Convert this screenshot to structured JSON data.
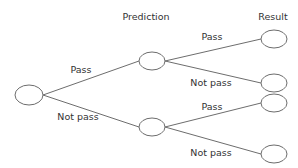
{
  "diagram": {
    "type": "decision-tree",
    "headers": {
      "prediction": "Prediction",
      "result": "Result"
    },
    "colors": {
      "line": "#6d6d6d",
      "text": "#333333",
      "node_fill": "#ffffff"
    },
    "nodes": [
      {
        "id": "root",
        "level": 0,
        "cx": 29,
        "cy": 95,
        "rx": 14,
        "ry": 10
      },
      {
        "id": "pred-pass",
        "level": 1,
        "cx": 152,
        "cy": 61,
        "rx": 13,
        "ry": 9
      },
      {
        "id": "pred-notpass",
        "level": 1,
        "cx": 152,
        "cy": 127,
        "rx": 13,
        "ry": 9
      },
      {
        "id": "res-1",
        "level": 2,
        "cx": 274,
        "cy": 39,
        "rx": 13,
        "ry": 9
      },
      {
        "id": "res-2",
        "level": 2,
        "cx": 274,
        "cy": 83,
        "rx": 13,
        "ry": 9
      },
      {
        "id": "res-3",
        "level": 2,
        "cx": 274,
        "cy": 103,
        "rx": 13,
        "ry": 9
      },
      {
        "id": "res-4",
        "level": 2,
        "cx": 274,
        "cy": 154,
        "rx": 13,
        "ry": 9
      }
    ],
    "edges": [
      {
        "from": "root",
        "to": "pred-pass",
        "label": "Pass"
      },
      {
        "from": "root",
        "to": "pred-notpass",
        "label": "Not pass"
      },
      {
        "from": "pred-pass",
        "to": "res-1",
        "label": "Pass"
      },
      {
        "from": "pred-pass",
        "to": "res-2",
        "label": "Not pass"
      },
      {
        "from": "pred-notpass",
        "to": "res-3",
        "label": "Pass"
      },
      {
        "from": "pred-notpass",
        "to": "res-4",
        "label": "Not pass"
      }
    ]
  }
}
